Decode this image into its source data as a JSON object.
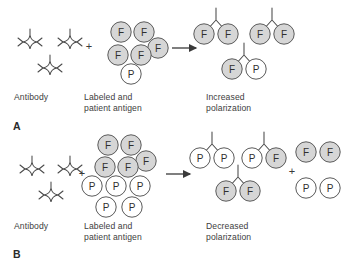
{
  "figure": {
    "background_color": "#ffffff",
    "ink_color": "#3a3a3a",
    "labeled_antigen_fill": "#d6d6d6",
    "patient_antigen_fill": "#ffffff",
    "plus_symbol": "+",
    "arrow_symbol": "→",
    "marker_labeled": "F",
    "marker_patient": "P"
  },
  "panels": [
    {
      "id": "A",
      "label": "A",
      "captions": {
        "reactant_left": "Antibody",
        "reactant_right": "Labeled and\npatient antigen",
        "product": "Increased\npolarization"
      },
      "antibodies_free": 3,
      "antigen_pool": {
        "labeled_count": 5,
        "patient_count": 1,
        "items": [
          {
            "marker": "F",
            "cx": 121,
            "cy": 32
          },
          {
            "marker": "F",
            "cx": 144,
            "cy": 32
          },
          {
            "marker": "F",
            "cx": 157,
            "cy": 48
          },
          {
            "marker": "F",
            "cx": 118,
            "cy": 55
          },
          {
            "marker": "F",
            "cx": 141,
            "cy": 55
          },
          {
            "marker": "P",
            "cx": 131,
            "cy": 74
          }
        ]
      },
      "complexes": [
        {
          "left_marker": "F",
          "right_marker": "F",
          "cx": 216,
          "cy": 24
        },
        {
          "left_marker": "F",
          "right_marker": "F",
          "cx": 272,
          "cy": 24
        },
        {
          "left_marker": "F",
          "right_marker": "P",
          "cx": 244,
          "cy": 59
        }
      ],
      "free_products": []
    },
    {
      "id": "B",
      "label": "B",
      "captions": {
        "reactant_left": "Antibody",
        "reactant_right": "Labeled and\npatient antigen",
        "product": "Decreased\npolarization"
      },
      "antibodies_free": 3,
      "antigen_pool": {
        "labeled_count": 5,
        "patient_count": 5,
        "items": [
          {
            "marker": "F",
            "cx": 108,
            "cy": 14
          },
          {
            "marker": "F",
            "cx": 131,
            "cy": 14
          },
          {
            "marker": "F",
            "cx": 146,
            "cy": 30
          },
          {
            "marker": "F",
            "cx": 105,
            "cy": 36
          },
          {
            "marker": "F",
            "cx": 128,
            "cy": 36
          },
          {
            "marker": "P",
            "cx": 92,
            "cy": 55
          },
          {
            "marker": "P",
            "cx": 116,
            "cy": 55
          },
          {
            "marker": "P",
            "cx": 140,
            "cy": 55
          },
          {
            "marker": "P",
            "cx": 106,
            "cy": 76
          },
          {
            "marker": "P",
            "cx": 132,
            "cy": 76
          }
        ]
      },
      "complexes": [
        {
          "left_marker": "P",
          "right_marker": "P",
          "cx": 212,
          "cy": 17
        },
        {
          "left_marker": "P",
          "right_marker": "F",
          "cx": 264,
          "cy": 17
        },
        {
          "left_marker": "F",
          "right_marker": "F",
          "cx": 238,
          "cy": 50
        }
      ],
      "free_products": [
        {
          "marker": "F",
          "cx": 306,
          "cy": 21
        },
        {
          "marker": "F",
          "cx": 330,
          "cy": 21
        },
        {
          "marker": "P",
          "cx": 306,
          "cy": 57
        },
        {
          "marker": "P",
          "cx": 330,
          "cy": 57
        }
      ]
    }
  ]
}
